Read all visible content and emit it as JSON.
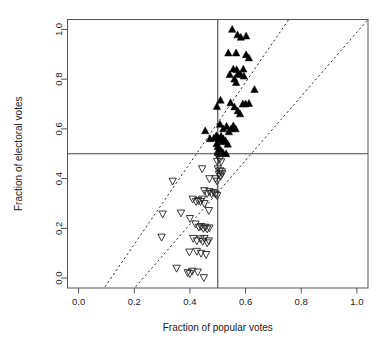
{
  "chart_data": {
    "type": "scatter",
    "title": "",
    "xlabel": "Fraction of popular votes",
    "ylabel": "Fraction of electoral votes",
    "xlim": [
      -0.04,
      1.04
    ],
    "ylim": [
      -0.04,
      1.04
    ],
    "xticks": [
      0.0,
      0.2,
      0.4,
      0.6,
      0.8,
      1.0
    ],
    "yticks": [
      0.0,
      0.2,
      0.4,
      0.6,
      0.8,
      1.0
    ],
    "xtick_labels": [
      "0.0",
      "0.2",
      "0.4",
      "0.6",
      "0.8",
      "1.0"
    ],
    "ytick_labels": [
      "0.0",
      "0.2",
      "0.4",
      "0.6",
      "0.8",
      "1.0"
    ],
    "grid": false,
    "legend": null,
    "reference_lines": [
      {
        "name": "vertical-half-line",
        "orientation": "vertical",
        "value": 0.5,
        "style": "solid"
      },
      {
        "name": "horizontal-half-line",
        "orientation": "horizontal",
        "value": 0.5,
        "style": "solid"
      }
    ],
    "dashed_lines": [
      {
        "name": "upper-dashed-line",
        "x0": 0.095,
        "y0": -0.035,
        "x1": 0.755,
        "y1": 1.04,
        "style": "dashed"
      },
      {
        "name": "lower-dashed-line",
        "x0": 0.205,
        "y0": -0.035,
        "x1": 1.04,
        "y1": 1.04,
        "style": "dashed"
      }
    ],
    "series": [
      {
        "name": "winner-electoral-majority",
        "marker": "filled-up-triangle",
        "color": "#000000",
        "points": [
          [
            0.552,
            1.0
          ],
          [
            0.571,
            0.978
          ],
          [
            0.583,
            0.968
          ],
          [
            0.602,
            0.973
          ],
          [
            0.538,
            0.905
          ],
          [
            0.566,
            0.905
          ],
          [
            0.602,
            0.898
          ],
          [
            0.612,
            0.885
          ],
          [
            0.543,
            0.818
          ],
          [
            0.556,
            0.84
          ],
          [
            0.568,
            0.838
          ],
          [
            0.572,
            0.82
          ],
          [
            0.56,
            0.8
          ],
          [
            0.566,
            0.786
          ],
          [
            0.582,
            0.818
          ],
          [
            0.592,
            0.84
          ],
          [
            0.594,
            0.812
          ],
          [
            0.632,
            0.758
          ],
          [
            0.51,
            0.715
          ],
          [
            0.546,
            0.705
          ],
          [
            0.56,
            0.688
          ],
          [
            0.572,
            0.672
          ],
          [
            0.58,
            0.66
          ],
          [
            0.59,
            0.7
          ],
          [
            0.6,
            0.7
          ],
          [
            0.612,
            0.702
          ],
          [
            0.497,
            0.69
          ],
          [
            0.508,
            0.618
          ],
          [
            0.52,
            0.6
          ],
          [
            0.532,
            0.61
          ],
          [
            0.54,
            0.588
          ],
          [
            0.548,
            0.6
          ],
          [
            0.556,
            0.612
          ],
          [
            0.564,
            0.6
          ],
          [
            0.455,
            0.592
          ],
          [
            0.472,
            0.56
          ],
          [
            0.486,
            0.562
          ],
          [
            0.495,
            0.572
          ],
          [
            0.5,
            0.566
          ],
          [
            0.504,
            0.558
          ],
          [
            0.508,
            0.556
          ],
          [
            0.512,
            0.57
          ],
          [
            0.516,
            0.548
          ],
          [
            0.52,
            0.56
          ],
          [
            0.528,
            0.552
          ],
          [
            0.536,
            0.538
          ],
          [
            0.496,
            0.54
          ],
          [
            0.5,
            0.528
          ],
          [
            0.505,
            0.52
          ],
          [
            0.512,
            0.51
          ],
          [
            0.5,
            0.505
          ],
          [
            0.508,
            0.5
          ],
          [
            0.518,
            0.505
          ],
          [
            0.53,
            0.5
          ]
        ]
      },
      {
        "name": "loser-electoral-minority",
        "marker": "open-down-triangle",
        "color": "#222222",
        "points": [
          [
            0.5,
            0.492
          ],
          [
            0.508,
            0.48
          ],
          [
            0.512,
            0.468
          ],
          [
            0.498,
            0.47
          ],
          [
            0.444,
            0.44
          ],
          [
            0.5,
            0.44
          ],
          [
            0.508,
            0.432
          ],
          [
            0.514,
            0.428
          ],
          [
            0.504,
            0.418
          ],
          [
            0.51,
            0.41
          ],
          [
            0.516,
            0.42
          ],
          [
            0.338,
            0.39
          ],
          [
            0.47,
            0.4
          ],
          [
            0.492,
            0.4
          ],
          [
            0.498,
            0.39
          ],
          [
            0.452,
            0.352
          ],
          [
            0.462,
            0.34
          ],
          [
            0.47,
            0.348
          ],
          [
            0.478,
            0.34
          ],
          [
            0.486,
            0.345
          ],
          [
            0.492,
            0.338
          ],
          [
            0.498,
            0.332
          ],
          [
            0.41,
            0.318
          ],
          [
            0.422,
            0.308
          ],
          [
            0.43,
            0.312
          ],
          [
            0.438,
            0.308
          ],
          [
            0.444,
            0.318
          ],
          [
            0.452,
            0.3
          ],
          [
            0.302,
            0.258
          ],
          [
            0.368,
            0.262
          ],
          [
            0.4,
            0.24
          ],
          [
            0.468,
            0.272
          ],
          [
            0.298,
            0.165
          ],
          [
            0.42,
            0.218
          ],
          [
            0.432,
            0.205
          ],
          [
            0.44,
            0.208
          ],
          [
            0.448,
            0.2
          ],
          [
            0.455,
            0.205
          ],
          [
            0.462,
            0.198
          ],
          [
            0.47,
            0.202
          ],
          [
            0.412,
            0.16
          ],
          [
            0.425,
            0.15
          ],
          [
            0.438,
            0.158
          ],
          [
            0.446,
            0.148
          ],
          [
            0.452,
            0.16
          ],
          [
            0.462,
            0.142
          ],
          [
            0.468,
            0.15
          ],
          [
            0.398,
            0.105
          ],
          [
            0.425,
            0.108
          ],
          [
            0.44,
            0.1
          ],
          [
            0.458,
            0.095
          ],
          [
            0.352,
            0.04
          ],
          [
            0.392,
            0.022
          ],
          [
            0.4,
            0.018
          ],
          [
            0.408,
            0.028
          ],
          [
            0.428,
            0.025
          ],
          [
            0.45,
            0.002
          ]
        ]
      }
    ]
  },
  "axes": {
    "x_title": "Fraction of popular votes",
    "y_title": "Fraction of electoral votes"
  }
}
